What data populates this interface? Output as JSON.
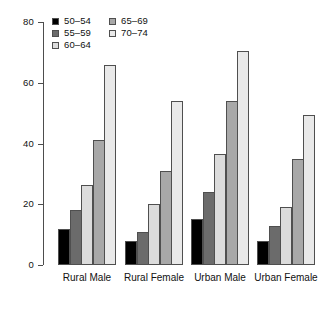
{
  "chart_data": {
    "type": "bar",
    "title": "",
    "subtitle": "",
    "xlabel": "",
    "ylabel": "",
    "categories": [
      "Rural Male",
      "Rural Female",
      "Urban Male",
      "Urban Female"
    ],
    "series": [
      {
        "name": "50–54",
        "color": "#000000",
        "values": [
          12,
          8,
          15,
          8
        ]
      },
      {
        "name": "55–59",
        "color": "#6b6b6b",
        "values": [
          18,
          11,
          24,
          13
        ]
      },
      {
        "name": "60–64",
        "color": "#dcdcdc",
        "values": [
          26.5,
          20,
          36.5,
          19
        ]
      },
      {
        "name": "65–69",
        "color": "#a8a8a8",
        "values": [
          41,
          31,
          54,
          35
        ]
      },
      {
        "name": "70–74",
        "color": "#e9e9e9",
        "values": [
          66,
          54,
          70.5,
          49.5
        ]
      }
    ],
    "ylim": [
      0,
      80
    ],
    "yticks": [
      0,
      20,
      40,
      60,
      80
    ],
    "ytick_labels": [
      "0",
      "20",
      "40",
      "60",
      "80"
    ],
    "grid": false,
    "legend_position": "top-left",
    "legend_columns": 2,
    "bar_border_color": "#4f4f4f",
    "axis_color": "#4d4d4d",
    "background": "#ffffff"
  }
}
